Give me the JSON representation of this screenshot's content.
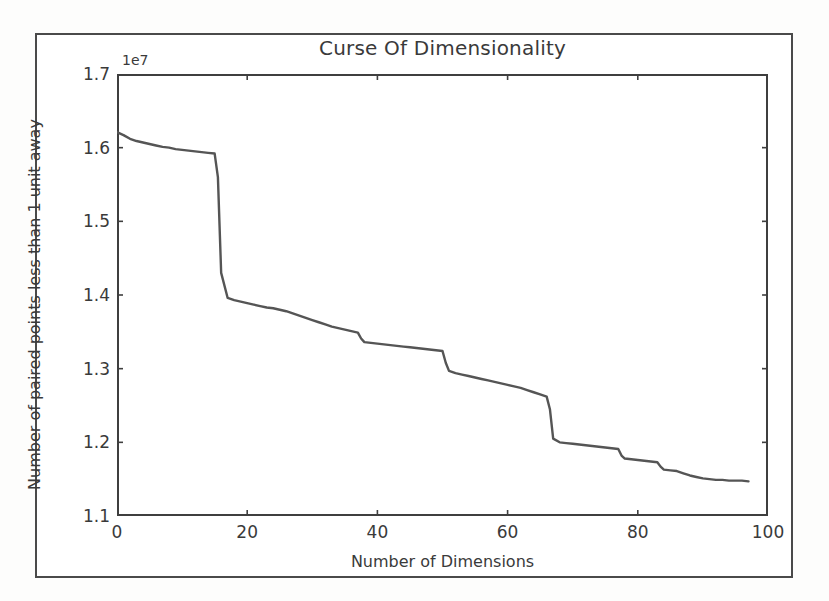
{
  "figure": {
    "title": "Curse Of Dimensionality",
    "y_offset_text": "1e7",
    "background_color": "#ffffff",
    "frame_color": "#4a4a4a",
    "line_color": "#555555"
  },
  "chart_data": {
    "type": "line",
    "title": "Curse Of Dimensionality",
    "xlabel": "Number of Dimensions",
    "ylabel": "Number of paired points less than 1 unit away",
    "y_offset_label": "1e7",
    "y_scale_factor": 10000000,
    "xlim": [
      0,
      100
    ],
    "ylim": [
      1.1,
      1.7
    ],
    "xticks": [
      0,
      20,
      40,
      60,
      80,
      100
    ],
    "xtick_labels": [
      "0",
      "20",
      "40",
      "60",
      "80",
      "100"
    ],
    "yticks": [
      1.1,
      1.2,
      1.3,
      1.4,
      1.5,
      1.6,
      1.7
    ],
    "ytick_labels": [
      "1.1",
      "1.2",
      "1.3",
      "1.4",
      "1.5",
      "1.6",
      "1.7"
    ],
    "grid": false,
    "legend": null,
    "series": [
      {
        "name": "paired points within 1 unit",
        "x": [
          0,
          1,
          2,
          3,
          4,
          5,
          6,
          7,
          8,
          9,
          10,
          11,
          12,
          13,
          14,
          15,
          15.5,
          16,
          17,
          18,
          19,
          20,
          21,
          22,
          23,
          24,
          25,
          26,
          27,
          28,
          29,
          30,
          31,
          32,
          33,
          34,
          35,
          36,
          37,
          37.5,
          38,
          39,
          40,
          41,
          42,
          43,
          44,
          45,
          46,
          47,
          48,
          49,
          50,
          50.5,
          51,
          52,
          53,
          54,
          55,
          56,
          57,
          58,
          59,
          60,
          61,
          62,
          63,
          64,
          65,
          66,
          66.5,
          67,
          68,
          69,
          70,
          71,
          72,
          73,
          74,
          75,
          76,
          77,
          77.5,
          78,
          79,
          80,
          81,
          82,
          83,
          83.5,
          84,
          85,
          86,
          87,
          88,
          89,
          90,
          91,
          92,
          93,
          94,
          95,
          96,
          97
        ],
        "y": [
          1.621,
          1.617,
          1.612,
          1.609,
          1.607,
          1.605,
          1.603,
          1.601,
          1.6,
          1.598,
          1.597,
          1.596,
          1.595,
          1.594,
          1.593,
          1.592,
          1.56,
          1.43,
          1.396,
          1.393,
          1.391,
          1.389,
          1.387,
          1.385,
          1.383,
          1.382,
          1.38,
          1.378,
          1.375,
          1.372,
          1.369,
          1.366,
          1.363,
          1.36,
          1.357,
          1.355,
          1.353,
          1.351,
          1.349,
          1.341,
          1.336,
          1.335,
          1.334,
          1.333,
          1.332,
          1.331,
          1.33,
          1.329,
          1.328,
          1.327,
          1.326,
          1.325,
          1.324,
          1.308,
          1.297,
          1.294,
          1.292,
          1.29,
          1.288,
          1.286,
          1.284,
          1.282,
          1.28,
          1.278,
          1.276,
          1.274,
          1.271,
          1.268,
          1.265,
          1.262,
          1.245,
          1.205,
          1.2,
          1.199,
          1.198,
          1.197,
          1.196,
          1.195,
          1.194,
          1.193,
          1.192,
          1.191,
          1.182,
          1.178,
          1.177,
          1.176,
          1.175,
          1.174,
          1.173,
          1.167,
          1.163,
          1.162,
          1.161,
          1.158,
          1.155,
          1.153,
          1.151,
          1.15,
          1.149,
          1.149,
          1.148,
          1.148,
          1.148,
          1.147
        ]
      }
    ]
  }
}
